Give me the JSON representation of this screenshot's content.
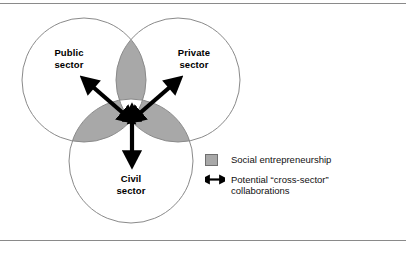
{
  "figure": {
    "circles": [
      {
        "id": "public",
        "label": "Public\nsector"
      },
      {
        "id": "private",
        "label": "Private\nsector"
      },
      {
        "id": "civil",
        "label": "Civil\nsector"
      }
    ],
    "legend": [
      {
        "marker": "gray-square-swatch",
        "text": "Social entrepreneurship"
      },
      {
        "marker": "double-headed-arrow",
        "text": "Potential “cross-sector”\ncollaborations"
      }
    ],
    "colors": {
      "overlap_fill": "#a8a8a8",
      "overlap_stroke": "#6f6f6f",
      "circle_stroke": "#8a8a8a",
      "circle_fill": "#ffffff",
      "arrow": "#000000",
      "rule": "#8a8a8a",
      "text": "#000000"
    },
    "arrows": [
      {
        "id": "public-to-center",
        "direction": "up-left",
        "double_headed": true
      },
      {
        "id": "private-to-center",
        "direction": "up-right",
        "double_headed": true
      },
      {
        "id": "civil-to-center",
        "direction": "down",
        "double_headed": true
      }
    ]
  }
}
